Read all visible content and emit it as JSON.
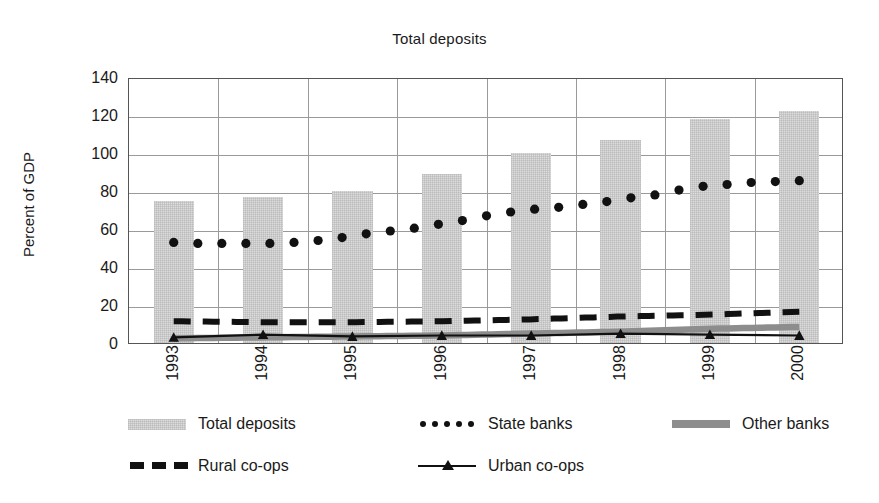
{
  "chart_data": {
    "type": "bar",
    "title": "Total deposits",
    "xlabel": "",
    "ylabel": "Percent of GDP",
    "categories": [
      "1993",
      "1994",
      "1995",
      "1996",
      "1997",
      "1998",
      "1999",
      "2000"
    ],
    "ylim": [
      0,
      140
    ],
    "ytick_values": [
      0,
      20,
      40,
      60,
      80,
      100,
      120,
      140
    ],
    "ytick_labels": [
      "0",
      "20",
      "40",
      "60",
      "80",
      "100",
      "120",
      "140"
    ],
    "grid": "horizontal-and-vertical",
    "legend_position": "below",
    "series": [
      {
        "name": "Total deposits",
        "render": "bar",
        "color": "#dcdcdc",
        "values": [
          75,
          77,
          80,
          89,
          100,
          107,
          118,
          122
        ]
      },
      {
        "name": "State banks",
        "render": "dotted",
        "color": "#111111",
        "values": [
          54,
          54,
          55,
          62,
          70,
          76,
          84,
          86
        ],
        "dense_points": [
          54,
          53.5,
          53.5,
          53.5,
          53.5,
          54,
          55,
          56.5,
          58.5,
          60,
          61.5,
          63.5,
          65.5,
          68,
          70,
          71.5,
          72.5,
          74,
          75.5,
          77.5,
          79,
          81.5,
          83.5,
          84.5,
          85.5,
          86,
          86.5
        ]
      },
      {
        "name": "Other banks",
        "render": "thick-line",
        "color": "#8d8d8d",
        "values": [
          3.5,
          4,
          4.5,
          5,
          6,
          7,
          8.5,
          9.5
        ]
      },
      {
        "name": "Rural co-ops",
        "render": "dashed",
        "color": "#111111",
        "values": [
          12.5,
          12,
          12,
          12.5,
          13.5,
          15,
          16,
          17.5
        ]
      },
      {
        "name": "Urban co-ops",
        "render": "line-triangle",
        "color": "#111111",
        "values": [
          4,
          5.5,
          4.5,
          5,
          5,
          6,
          5.5,
          5
        ]
      }
    ]
  },
  "legend": {
    "rows": [
      [
        {
          "key": "bar-swatch",
          "label": "Total deposits"
        },
        {
          "key": "dotted-swatch",
          "label": "State banks"
        },
        {
          "key": "grey-bar-swatch",
          "label": "Other banks"
        }
      ],
      [
        {
          "key": "dashed-swatch",
          "label": "Rural co-ops"
        },
        {
          "key": "line-triangle-swatch",
          "label": "Urban co-ops"
        }
      ]
    ]
  },
  "colors": {
    "bar_fill": "#dcdcdc",
    "other_banks": "#8d8d8d",
    "ink": "#111111",
    "grid": "#9a9a9a",
    "frame": "#555555",
    "background": "#ffffff"
  }
}
